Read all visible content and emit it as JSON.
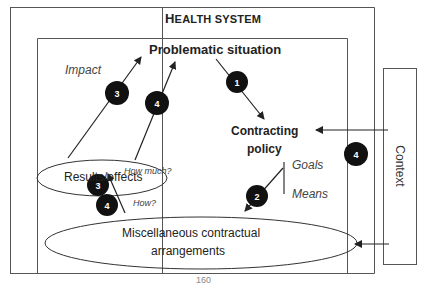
{
  "diagram": {
    "frames": {
      "outer_title_first": "H",
      "outer_title_rest": "EALTH SYSTEM",
      "context_label": "Context"
    },
    "nodes": {
      "problematic_situation": "Problematic situation",
      "contracting_policy_line1": "Contracting",
      "contracting_policy_line2": "policy",
      "results_effects": "Results/effects",
      "arrangements_line1": "Miscellaneous contractual",
      "arrangements_line2": "arrangements"
    },
    "annotations": {
      "impact": "Impact",
      "goals": "Goals",
      "means": "Means",
      "how_much": "How much?",
      "how": "How?"
    },
    "markers": [
      {
        "id": "m1",
        "label": "1"
      },
      {
        "id": "m2",
        "label": "2"
      },
      {
        "id": "m3a",
        "label": "3"
      },
      {
        "id": "m4a",
        "label": "4"
      },
      {
        "id": "m3b",
        "label": "3"
      },
      {
        "id": "m4b",
        "label": "4"
      },
      {
        "id": "m4c",
        "label": "4"
      }
    ],
    "page_number_fragment": "160",
    "colors": {
      "line": "#333333",
      "marker_fill": "#111111",
      "marker_text": "#ffffff",
      "frame": "#555555"
    }
  }
}
